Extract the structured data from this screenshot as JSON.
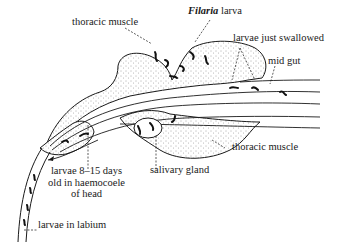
{
  "diagram": {
    "colors": {
      "ink": "#1a1a1a",
      "stipple": "#555555",
      "background": "#ffffff"
    },
    "labels": {
      "thoracic_muscle_top": "thoracic muscle",
      "filaria_larva_italic": "Filaria",
      "filaria_larva_rest": " larva",
      "larvae_just_swallowed": "larvae just swallowed",
      "mid_gut": "mid gut",
      "thoracic_muscle_bottom": "thoracic muscle",
      "salivary_gland": "salivary gland",
      "larvae_head": "larvae 8–15 days\nold in haemocoele\nof head",
      "larvae_labium": "larvae in labium"
    }
  }
}
